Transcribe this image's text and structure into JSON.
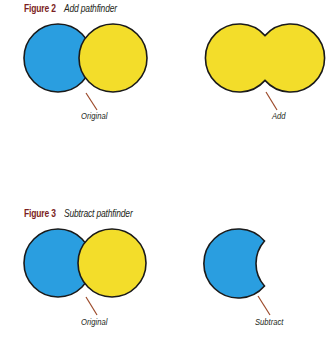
{
  "colors": {
    "blue_fill": "#2a9ee0",
    "yellow_fill": "#f3dd2a",
    "outline": "#1a1a1a",
    "leader_line": "#9c4a2a",
    "figure_number": "#7b1e22",
    "caption_text": "#231f20"
  },
  "figures": [
    {
      "number": "Figure 2",
      "title": "Add pathfinder",
      "panels": [
        {
          "label": "Original",
          "shape": "two-overlapping-circles-blue-yellow"
        },
        {
          "label": "Add",
          "shape": "merged-yellow-union"
        }
      ]
    },
    {
      "number": "Figure 3",
      "title": "Subtract pathfinder",
      "panels": [
        {
          "label": "Original",
          "shape": "two-overlapping-circles-blue-yellow"
        },
        {
          "label": "Subtract",
          "shape": "blue-crescent"
        }
      ]
    }
  ]
}
